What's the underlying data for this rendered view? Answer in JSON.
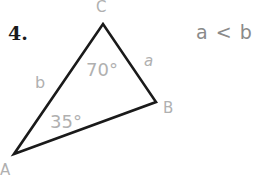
{
  "problem": {
    "number": "4.",
    "relation": "a < b"
  },
  "triangle": {
    "vertices": {
      "A": {
        "label": "A",
        "x": 14,
        "y": 154
      },
      "B": {
        "label": "B",
        "x": 156,
        "y": 102
      },
      "C": {
        "label": "C",
        "x": 103,
        "y": 24
      }
    },
    "sides": {
      "a": "a",
      "b": "b"
    },
    "angles": {
      "C": "70°",
      "A": "35°"
    },
    "stroke_color": "#1a1a1a",
    "label_color": "#b0b0b0"
  }
}
